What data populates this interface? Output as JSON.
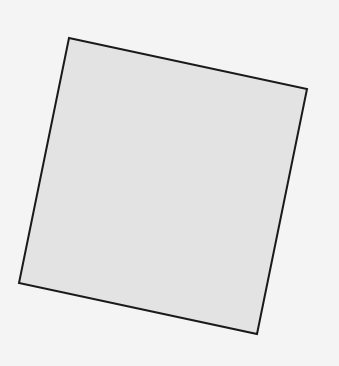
{
  "diagram": {
    "background_color": "#f4f4f4",
    "shapes": [
      {
        "type": "quadrilateral",
        "description": "rotated square",
        "fill": "#e3e3e3",
        "stroke": "#1a1a1a",
        "stroke_width": 2,
        "points": [
          [
            69,
            38
          ],
          [
            307,
            89
          ],
          [
            257,
            334
          ],
          [
            19,
            283
          ]
        ]
      }
    ]
  }
}
